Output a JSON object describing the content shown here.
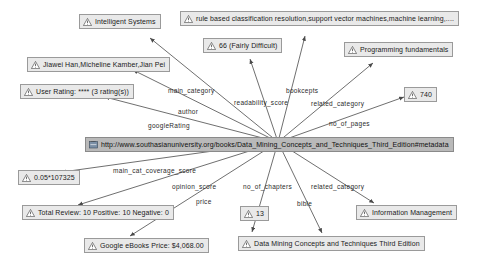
{
  "diagram": {
    "type": "node-link-graph",
    "accent_node_fill": "#e9e9e9",
    "accent_node_border": "#9a9a9a",
    "central_node_fill": "#b9b9b9",
    "edge_color": "#4a4a4a"
  },
  "nodes": [
    {
      "id": "subject",
      "label": "http://www.southasianuniversity.org/books/Data_Mining_Concepts_and_Techniques_Third_Edition#metadata",
      "icon": "url-icon"
    },
    {
      "id": "intelligent",
      "label": "Intelligent Systems",
      "icon": "warning-icon"
    },
    {
      "id": "concepts",
      "label": "rule based classification resolution,support vector machines,machine learning,....",
      "icon": "warning-icon"
    },
    {
      "id": "readability",
      "label": "66 (Fairly Difficult)",
      "icon": "warning-icon"
    },
    {
      "id": "programming",
      "label": "Programming fundamentals",
      "icon": "warning-icon"
    },
    {
      "id": "authors",
      "label": "Jiawei Han,Micheline Kamber,Jian Pei",
      "icon": "warning-icon"
    },
    {
      "id": "rating",
      "label": "User Rating: **** (3 rating(s))",
      "icon": "warning-icon"
    },
    {
      "id": "pages",
      "label": "740",
      "icon": "warning-icon"
    },
    {
      "id": "coverage",
      "label": "0.05*107325",
      "icon": "warning-icon"
    },
    {
      "id": "review",
      "label": "Total Review: 10 Positive: 10 Negative: 0",
      "icon": "warning-icon"
    },
    {
      "id": "chapters",
      "label": "13",
      "icon": "warning-icon"
    },
    {
      "id": "infomanagement",
      "label": "Information Management",
      "icon": "warning-icon"
    },
    {
      "id": "price",
      "label": "Google eBooks Price: $4,068.00",
      "icon": "warning-icon"
    },
    {
      "id": "title",
      "label": "Data Mining Concepts and Techniques Third Edition",
      "icon": "warning-icon"
    }
  ],
  "edges": [
    {
      "id": "e-main-category",
      "label": "main_category"
    },
    {
      "id": "e-author",
      "label": "author"
    },
    {
      "id": "e-googlerating",
      "label": "googleRating"
    },
    {
      "id": "e-readability",
      "label": "readability_score"
    },
    {
      "id": "e-bookcepts",
      "label": "bookcepts"
    },
    {
      "id": "e-related-top",
      "label": "related_category"
    },
    {
      "id": "e-no-of-pages",
      "label": "no_of_pages"
    },
    {
      "id": "e-coverage",
      "label": "main_cat_coverage_score"
    },
    {
      "id": "e-opinion",
      "label": "opinion_score"
    },
    {
      "id": "e-price",
      "label": "price"
    },
    {
      "id": "e-no-of-chapters",
      "label": "no_of_chapters"
    },
    {
      "id": "e-related-bottom",
      "label": "related_category"
    },
    {
      "id": "e-bible",
      "label": "bible"
    }
  ]
}
